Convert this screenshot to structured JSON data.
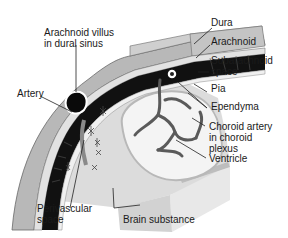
{
  "diagram": {
    "type": "anatomical-cross-section",
    "labels": {
      "arachnoid_villus_line1": "Arachnoid villus",
      "arachnoid_villus_line2": "in dural sinus",
      "artery": "Artery",
      "dura": "Dura",
      "arachnoid": "Arachnoid",
      "subarachnoid_line1": "Subarachnoid",
      "subarachnoid_line2": "space",
      "pia": "Pia",
      "ependyma": "Ependyma",
      "choroid_line1": "Choroid artery",
      "choroid_line2": "in choroid",
      "choroid_line3": "plexus",
      "ventricle": "Ventricle",
      "perivascular_line1": "Perivascular",
      "perivascular_line2": "space",
      "brain_substance": "Brain substance"
    },
    "colors": {
      "dura": "#b8b8b8",
      "arachnoid": "#d6d6d6",
      "subarachnoid_space": "#111111",
      "pia": "#ededed",
      "brain_substance": "#dcdcdc",
      "ventricle": "#f2f2f2",
      "vessels": "#5a5a5a",
      "leader_lines": "#222222"
    }
  }
}
